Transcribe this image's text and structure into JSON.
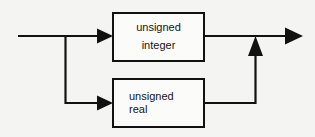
{
  "diagram": {
    "type": "railroad-syntax-diagram",
    "background_color": "#f4f4f2",
    "line_color": "#111111",
    "box_fill_color": "#fbfbf9",
    "text_color": "#141414",
    "nodes": [
      {
        "id": "unsigned-integer",
        "lines": [
          "unsigned",
          "integer"
        ],
        "align": "center"
      },
      {
        "id": "unsigned-real",
        "lines": [
          "unsigned",
          "real"
        ],
        "align": "left"
      }
    ],
    "connectors": {
      "entry_label": "input",
      "exit_label": "output",
      "branch_description": "input splits to two parallel alternatives which rejoin at the output"
    }
  }
}
